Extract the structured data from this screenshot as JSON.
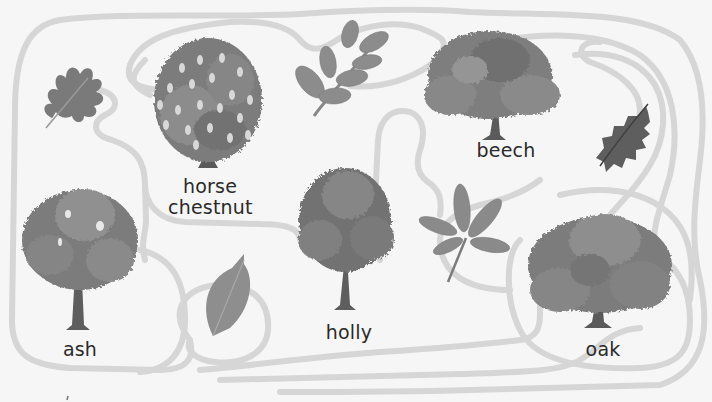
{
  "activity": {
    "type": "leaf-to-tree maze",
    "colors": {
      "background": "#f6f6f6",
      "path": "#d6d6d6",
      "foliage_dark": "#6e6e6e",
      "foliage_mid": "#8a8a8a",
      "foliage_light": "#a3a3a3",
      "trunk": "#5a5a5a",
      "text": "#2a2a2a"
    }
  },
  "trees": [
    {
      "id": "horse-chestnut",
      "label_line1": "horse",
      "label_line2": "chestnut"
    },
    {
      "id": "beech",
      "label": "beech"
    },
    {
      "id": "ash",
      "label": "ash"
    },
    {
      "id": "holly",
      "label": "holly"
    },
    {
      "id": "oak",
      "label": "oak"
    }
  ],
  "leaves": [
    {
      "id": "oak-leaf",
      "icon": "oak-leaf-icon"
    },
    {
      "id": "ash-leaf",
      "icon": "ash-leaf-icon"
    },
    {
      "id": "holly-leaf",
      "icon": "holly-leaf-icon"
    },
    {
      "id": "beech-leaf",
      "icon": "beech-leaf-icon"
    },
    {
      "id": "horse-chestnut-leaf",
      "icon": "horse-chestnut-leaf-icon"
    }
  ]
}
